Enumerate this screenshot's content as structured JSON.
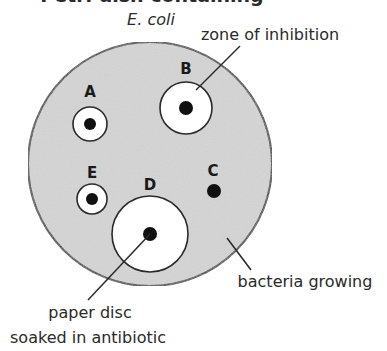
{
  "title": {
    "text": "Petri dish containing",
    "organism": "E. coli"
  },
  "colors": {
    "agar": "#cfcfcf",
    "outline": "#2a2a2a",
    "zone": "#ffffff",
    "disc": "#111111",
    "text": "#2a2a2a"
  },
  "dish": {
    "cx": 150,
    "cy": 164,
    "r": 122
  },
  "discs": [
    {
      "id": "A",
      "label": "A",
      "cx": 90,
      "cy": 124,
      "zone_r": 17,
      "disc_r": 6,
      "label_x": 90,
      "label_y": 97
    },
    {
      "id": "B",
      "label": "B",
      "cx": 186,
      "cy": 108,
      "zone_r": 26,
      "disc_r": 7,
      "label_x": 186,
      "label_y": 74
    },
    {
      "id": "C",
      "label": "C",
      "cx": 214,
      "cy": 191,
      "zone_r": 0,
      "disc_r": 7,
      "label_x": 213,
      "label_y": 176
    },
    {
      "id": "D",
      "label": "D",
      "cx": 150,
      "cy": 234,
      "zone_r": 38,
      "disc_r": 7,
      "label_x": 150,
      "label_y": 190
    },
    {
      "id": "E",
      "label": "E",
      "cx": 92,
      "cy": 199,
      "zone_r": 15,
      "disc_r": 6,
      "label_x": 92,
      "label_y": 178
    }
  ],
  "annotations": {
    "zone_of_inhibition": "zone of inhibition",
    "bacteria_growing": "bacteria growing",
    "paper_disc_line1": "paper disc",
    "paper_disc_line2": "soaked in antibiotic"
  }
}
